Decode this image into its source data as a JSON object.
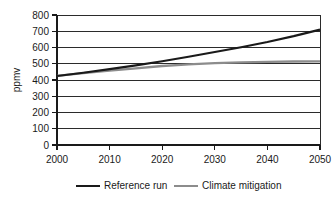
{
  "chart_data": {
    "type": "line",
    "title": "",
    "xlabel": "",
    "ylabel": "ppmv",
    "xlim": [
      2000,
      2050
    ],
    "ylim": [
      0,
      800
    ],
    "grid": true,
    "legend_position": "bottom",
    "x": [
      2000,
      2005,
      2010,
      2015,
      2020,
      2025,
      2030,
      2035,
      2040,
      2045,
      2050
    ],
    "xticks": [
      "2000",
      "2010",
      "2020",
      "2030",
      "2040",
      "2050"
    ],
    "yticks": [
      "0",
      "100",
      "200",
      "300",
      "400",
      "500",
      "600",
      "700",
      "800"
    ],
    "series": [
      {
        "name": "Reference run",
        "color": "#1a1a1a",
        "values": [
          425,
          445,
          467,
          490,
          515,
          543,
          572,
          602,
          634,
          670,
          710
        ]
      },
      {
        "name": "Climate mitigation",
        "color": "#8c8c8c",
        "values": [
          425,
          442,
          458,
          472,
          486,
          496,
          504,
          509,
          512,
          514,
          515
        ]
      }
    ]
  },
  "axis": {
    "y_title": "ppmv",
    "y_tick_labels": [
      "800",
      "700",
      "600",
      "500",
      "400",
      "300",
      "200",
      "100",
      "0"
    ],
    "x_tick_labels": [
      "2000",
      "2010",
      "2020",
      "2030",
      "2040",
      "2050"
    ]
  },
  "legend": {
    "entries": [
      {
        "label": "Reference run",
        "color": "#1a1a1a"
      },
      {
        "label": "Climate mitigation",
        "color": "#8c8c8c"
      }
    ]
  }
}
